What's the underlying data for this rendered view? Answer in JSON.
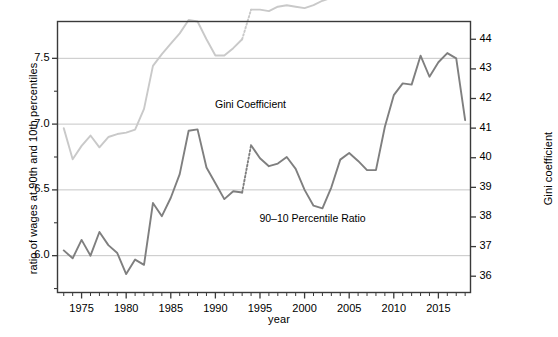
{
  "chart_data": {
    "type": "line",
    "title": "",
    "xlabel": "year",
    "ylabel": "ratio of wages at 90th and 10th percentiles",
    "ylabel_right": "Gini coefficient",
    "xlim": [
      1972.3,
      2018.6
    ],
    "ylim": [
      5.72,
      7.78
    ],
    "ylim_right": [
      35.45,
      44.6
    ],
    "grid": "horizontal",
    "legend_position": "inline-annotations",
    "xticks": [
      1975,
      1980,
      1985,
      1990,
      1995,
      2000,
      2005,
      2010,
      2015
    ],
    "xtick_labels": [
      "1975",
      "1980",
      "1985",
      "1990",
      "1995",
      "2000",
      "2005",
      "2010",
      "2015"
    ],
    "xticks_minor_step": 1,
    "yticks_left": [
      6.0,
      6.5,
      7.0,
      7.5
    ],
    "ytick_labels_left": [
      "6.0",
      "6.5",
      "7.0",
      "7.5"
    ],
    "yticks_left_minor": [
      5.75,
      6.25,
      6.75,
      7.25
    ],
    "yticks_right": [
      36,
      37,
      38,
      39,
      40,
      41,
      42,
      43,
      44
    ],
    "ytick_labels_right": [
      "36",
      "37",
      "38",
      "39",
      "40",
      "41",
      "42",
      "43",
      "44"
    ],
    "gridline_values_left": [
      6.0,
      6.5,
      7.0,
      7.5
    ],
    "series": [
      {
        "name": "90-10 Percentile Ratio",
        "axis": "left",
        "color": "#7f7f7f",
        "linewidth": 1.9,
        "annotation_label": "90–10 Percentile Ratio",
        "break_segment_dotted": [
          1993,
          1994
        ],
        "x": [
          1973,
          1974,
          1975,
          1976,
          1977,
          1978,
          1979,
          1980,
          1981,
          1982,
          1983,
          1984,
          1985,
          1986,
          1987,
          1988,
          1989,
          1990,
          1991,
          1992,
          1993,
          1994,
          1995,
          1996,
          1997,
          1998,
          1999,
          2000,
          2001,
          2002,
          2003,
          2004,
          2005,
          2006,
          2007,
          2008,
          2009,
          2010,
          2011,
          2012,
          2013,
          2014,
          2015,
          2016,
          2017,
          2018
        ],
        "y": [
          6.04,
          5.98,
          6.12,
          6.0,
          6.18,
          6.08,
          6.02,
          5.86,
          5.97,
          5.93,
          6.4,
          6.3,
          6.44,
          6.62,
          6.95,
          6.96,
          6.67,
          6.55,
          6.43,
          6.49,
          6.48,
          6.84,
          6.74,
          6.68,
          6.7,
          6.75,
          6.66,
          6.5,
          6.38,
          6.36,
          6.52,
          6.73,
          6.78,
          6.72,
          6.65,
          6.65,
          6.98,
          7.22,
          7.31,
          7.3,
          7.52,
          7.36,
          7.47,
          7.54,
          7.5,
          7.03
        ]
      },
      {
        "name": "Gini Coefficient",
        "axis": "right",
        "color": "#c9c9c9",
        "linewidth": 1.9,
        "annotation_label": "Gini Coefficient",
        "break_segment_dotted": [
          1993,
          1994
        ],
        "x": [
          1973,
          1974,
          1975,
          1976,
          1977,
          1978,
          1979,
          1980,
          1981,
          1982,
          1983,
          1984,
          1985,
          1986,
          1987,
          1988,
          1989,
          1990,
          1991,
          1992,
          1993,
          1994,
          1995,
          1996,
          1997,
          1998,
          1999,
          2000,
          2001,
          2002,
          2003,
          2004,
          2005,
          2006,
          2007,
          2008,
          2009,
          2010,
          2011,
          2012,
          2013,
          2014,
          2015,
          2016,
          2017,
          2018
        ],
        "y_left_scale": [
          6.04,
          5.82,
          5.92,
          6.0,
          5.91,
          5.99,
          6.01,
          6.02,
          6.04,
          6.2,
          6.51,
          6.6,
          6.68,
          6.76,
          6.86,
          6.85,
          6.72,
          6.6,
          6.6,
          6.65,
          6.72,
          6.94,
          6.94,
          6.93,
          6.96,
          6.97,
          6.96,
          6.95,
          6.97,
          7.0,
          7.02,
          7.03,
          7.14,
          7.18,
          7.2,
          7.27,
          7.36,
          7.42,
          7.44,
          7.46,
          7.54,
          7.5,
          7.52,
          7.53,
          7.52,
          7.5
        ],
        "y": [
          41.0,
          39.95,
          40.4,
          40.75,
          40.35,
          40.7,
          40.8,
          40.85,
          40.95,
          41.65,
          43.1,
          43.5,
          43.85,
          44.2,
          44.65,
          44.6,
          44.0,
          43.45,
          43.45,
          43.7,
          44.0,
          45.0,
          45.0,
          44.95,
          45.1,
          45.15,
          45.1,
          45.05,
          45.15,
          45.3,
          45.4,
          45.45,
          45.95,
          46.15,
          46.25,
          46.55,
          46.95,
          47.25,
          47.35,
          47.45,
          47.8,
          47.6,
          47.7,
          47.75,
          47.7,
          47.6
        ]
      }
    ],
    "annotations": [
      {
        "text": "Gini Coefficient",
        "x_year": 1995,
        "y_value": 7.14
      },
      {
        "text": "90–10 Percentile Ratio",
        "x_year": 2002,
        "y_value": 6.27
      }
    ]
  },
  "axes": {
    "left_title": "ratio of wages at 90th and 10th percentiles",
    "right_title": "Gini coefficient",
    "bottom_title": "year"
  },
  "labels": {
    "left_ticks": [
      "7.5",
      "7.0",
      "6.5",
      "6.0"
    ],
    "right_ticks": [
      "44",
      "43",
      "42",
      "41",
      "40",
      "39",
      "38",
      "37",
      "36"
    ],
    "x_ticks": [
      "1975",
      "1980",
      "1985",
      "1990",
      "1995",
      "2000",
      "2005",
      "2010",
      "2015"
    ],
    "series_gini": "Gini Coefficient",
    "series_ratio": "90–10 Percentile Ratio"
  },
  "style": {
    "frame_color": "#3a3a3a",
    "grid_color": "#bfbfbf",
    "gini_color": "#c9c9c9",
    "ratio_color": "#7f7f7f",
    "background": "#ffffff"
  }
}
